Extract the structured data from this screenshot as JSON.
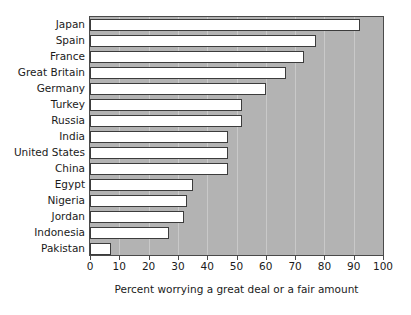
{
  "chart_data": {
    "type": "bar",
    "orientation": "horizontal",
    "title": "",
    "subtitle": "",
    "xlabel": "Percent worrying a great deal or a fair amount",
    "ylabel": "",
    "xlim": [
      0,
      100
    ],
    "xticks": [
      0,
      10,
      20,
      30,
      40,
      50,
      60,
      70,
      80,
      90,
      100
    ],
    "xtick_labels": [
      "0",
      "10",
      "20",
      "30",
      "40",
      "50",
      "60",
      "70",
      "80",
      "90",
      "100"
    ],
    "grid": true,
    "legend": null,
    "categories": [
      "Japan",
      "Spain",
      "France",
      "Great Britain",
      "Germany",
      "Turkey",
      "Russia",
      "India",
      "United States",
      "China",
      "Egypt",
      "Nigeria",
      "Jordan",
      "Indonesia",
      "Pakistan"
    ],
    "values": [
      92,
      77,
      73,
      67,
      60,
      52,
      52,
      47,
      47,
      47,
      35,
      33,
      32,
      27,
      7
    ],
    "colors": {
      "plot_background": "#b3b3b3",
      "bar_fill": "#ffffff",
      "bar_edge": "#3c3c3c",
      "gridline": "#c9c9c9",
      "axis": "#4a4a4a",
      "text": "#1a1a1a",
      "page_background": "#ffffff"
    }
  }
}
